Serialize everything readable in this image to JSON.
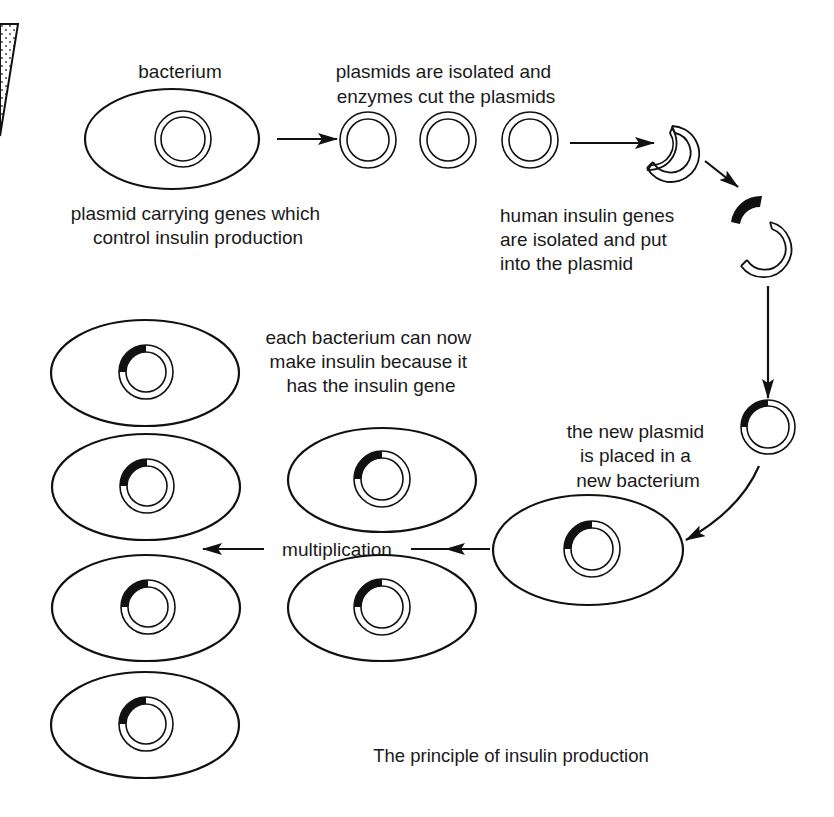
{
  "diagram": {
    "caption": "The principle of insulin production",
    "labels": {
      "bacterium": "bacterium",
      "plasmids_isolated": [
        "plasmids are isolated and",
        "enzymes cut the plasmids"
      ],
      "plasmid_carrying": [
        "plasmid carrying genes which",
        "control insulin production"
      ],
      "human_genes": [
        "human insulin genes",
        "are isolated and put",
        "into the plasmid"
      ],
      "each_bacterium": [
        "each bacterium can now",
        "make insulin because it",
        "has the insulin gene"
      ],
      "new_plasmid": [
        "the new plasmid",
        "is placed in a",
        "new bacterium"
      ],
      "multiplication": "multiplication"
    },
    "steps": [
      {
        "id": 1,
        "name": "original bacterium with plasmid"
      },
      {
        "id": 2,
        "name": "plasmids isolated",
        "count": 3
      },
      {
        "id": 3,
        "name": "plasmid cut open by enzymes"
      },
      {
        "id": 4,
        "name": "human insulin gene inserted"
      },
      {
        "id": 5,
        "name": "recombinant plasmid"
      },
      {
        "id": 6,
        "name": "new bacterium with recombinant plasmid"
      },
      {
        "id": 7,
        "name": "multiplication",
        "daughter_bacteria": 6
      }
    ],
    "colors": {
      "ink": "#111111",
      "background": "#ffffff",
      "gene": "#111111"
    }
  }
}
